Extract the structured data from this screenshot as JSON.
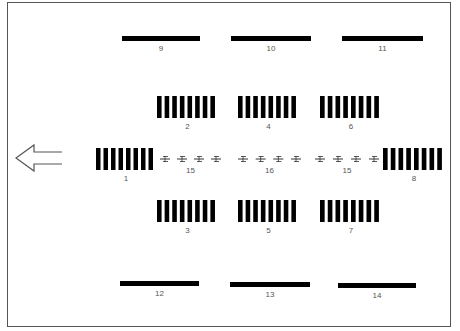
{
  "diagram": {
    "direction_arrow": {
      "icon": "arrow-left-icon",
      "direction": "left"
    },
    "bars": [
      {
        "id": "9",
        "label": "9"
      },
      {
        "id": "10",
        "label": "10"
      },
      {
        "id": "11",
        "label": "11"
      },
      {
        "id": "12",
        "label": "12"
      },
      {
        "id": "13",
        "label": "13"
      },
      {
        "id": "14",
        "label": "14"
      }
    ],
    "comb_blocks": [
      {
        "id": "1",
        "label": "1",
        "stripes": 8
      },
      {
        "id": "2",
        "label": "2",
        "stripes": 8
      },
      {
        "id": "3",
        "label": "3",
        "stripes": 8
      },
      {
        "id": "4",
        "label": "4",
        "stripes": 8
      },
      {
        "id": "5",
        "label": "5",
        "stripes": 8
      },
      {
        "id": "6",
        "label": "6",
        "stripes": 8
      },
      {
        "id": "7",
        "label": "7",
        "stripes": 8
      },
      {
        "id": "8",
        "label": "8",
        "stripes": 8
      }
    ],
    "symbol_groups": [
      {
        "id": "15a",
        "label": "15",
        "count": 4
      },
      {
        "id": "16",
        "label": "16",
        "count": 4
      },
      {
        "id": "15b",
        "label": "15",
        "count": 4
      }
    ],
    "colors": {
      "ink": "#000000",
      "label": "#555555",
      "frame": "#555555",
      "background": "#ffffff"
    }
  }
}
